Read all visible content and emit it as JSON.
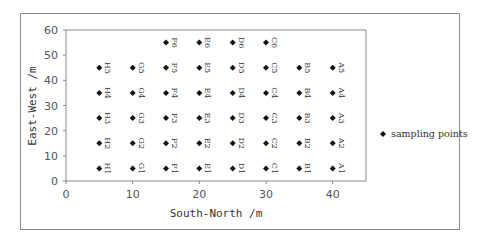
{
  "chart_data": {
    "type": "scatter",
    "title": "",
    "xlabel": "South-North /m",
    "ylabel": "East-West /m",
    "xlim": [
      0,
      45
    ],
    "ylim": [
      0,
      60
    ],
    "x_ticks": [
      0,
      10,
      20,
      30,
      40
    ],
    "y_ticks": [
      0,
      10,
      20,
      30,
      40,
      50,
      60
    ],
    "grid": false,
    "legend": {
      "position": "right",
      "entries": [
        "sampling points"
      ]
    },
    "series": [
      {
        "name": "sampling points",
        "marker": "diamond",
        "points": [
          {
            "label": "H1",
            "x": 5,
            "y": 5
          },
          {
            "label": "H2",
            "x": 5,
            "y": 15
          },
          {
            "label": "H3",
            "x": 5,
            "y": 25
          },
          {
            "label": "H4",
            "x": 5,
            "y": 35
          },
          {
            "label": "H5",
            "x": 5,
            "y": 45
          },
          {
            "label": "G1",
            "x": 10,
            "y": 5
          },
          {
            "label": "G2",
            "x": 10,
            "y": 15
          },
          {
            "label": "G3",
            "x": 10,
            "y": 25
          },
          {
            "label": "G4",
            "x": 10,
            "y": 35
          },
          {
            "label": "G5",
            "x": 10,
            "y": 45
          },
          {
            "label": "F1",
            "x": 15,
            "y": 5
          },
          {
            "label": "F2",
            "x": 15,
            "y": 15
          },
          {
            "label": "F3",
            "x": 15,
            "y": 25
          },
          {
            "label": "F4",
            "x": 15,
            "y": 35
          },
          {
            "label": "F5",
            "x": 15,
            "y": 45
          },
          {
            "label": "F6",
            "x": 15,
            "y": 55
          },
          {
            "label": "E1",
            "x": 20,
            "y": 5
          },
          {
            "label": "E2",
            "x": 20,
            "y": 15
          },
          {
            "label": "E3",
            "x": 20,
            "y": 25
          },
          {
            "label": "E4",
            "x": 20,
            "y": 35
          },
          {
            "label": "E5",
            "x": 20,
            "y": 45
          },
          {
            "label": "E6",
            "x": 20,
            "y": 55
          },
          {
            "label": "D1",
            "x": 25,
            "y": 5
          },
          {
            "label": "D2",
            "x": 25,
            "y": 15
          },
          {
            "label": "D3",
            "x": 25,
            "y": 25
          },
          {
            "label": "D4",
            "x": 25,
            "y": 35
          },
          {
            "label": "D5",
            "x": 25,
            "y": 45
          },
          {
            "label": "D6",
            "x": 25,
            "y": 55
          },
          {
            "label": "C1",
            "x": 30,
            "y": 5
          },
          {
            "label": "C2",
            "x": 30,
            "y": 15
          },
          {
            "label": "C3",
            "x": 30,
            "y": 25
          },
          {
            "label": "C4",
            "x": 30,
            "y": 35
          },
          {
            "label": "C5",
            "x": 30,
            "y": 45
          },
          {
            "label": "C6",
            "x": 30,
            "y": 55
          },
          {
            "label": "B1",
            "x": 35,
            "y": 5
          },
          {
            "label": "B2",
            "x": 35,
            "y": 15
          },
          {
            "label": "B3",
            "x": 35,
            "y": 25
          },
          {
            "label": "B4",
            "x": 35,
            "y": 35
          },
          {
            "label": "B5",
            "x": 35,
            "y": 45
          },
          {
            "label": "A1",
            "x": 40,
            "y": 5
          },
          {
            "label": "A2",
            "x": 40,
            "y": 15
          },
          {
            "label": "A3",
            "x": 40,
            "y": 25
          },
          {
            "label": "A4",
            "x": 40,
            "y": 35
          },
          {
            "label": "A5",
            "x": 40,
            "y": 45
          }
        ]
      }
    ]
  },
  "colors": {
    "marker": "#111111",
    "axis": "#888888",
    "text": "#333333"
  }
}
